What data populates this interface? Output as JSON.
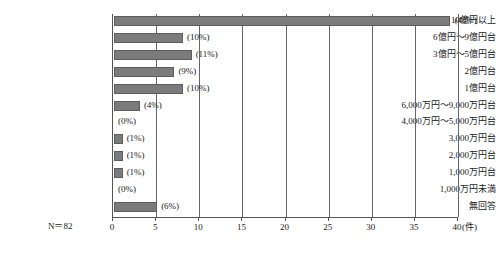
{
  "chart_data": {
    "type": "bar",
    "orientation": "horizontal",
    "title": "",
    "subtitle": "",
    "xlabel": "(件)",
    "ylabel": "",
    "xlim": [
      0,
      40
    ],
    "grid": true,
    "legend": "none",
    "note": "N＝82",
    "bar_color": "#7b7b7b",
    "bar_edge_color": "#5d5d5d",
    "xticks": [
      0,
      5,
      10,
      15,
      20,
      25,
      30,
      35,
      40
    ],
    "xtick_labels": [
      "0",
      "5",
      "10",
      "15",
      "20",
      "25",
      "30",
      "35",
      "40"
    ],
    "categories": [
      "10億円以上",
      "6億円〜9億円台",
      "3億円〜5億円台",
      "2億円台",
      "1億円台",
      "6,000万円〜9,000万円台",
      "4,000万円〜5,000万円台",
      "3,000万円台",
      "2,000万円台",
      "1,000万円台",
      "1,000万円未満",
      "無回答"
    ],
    "values": [
      39,
      8,
      9,
      7,
      8,
      3,
      0,
      1,
      1,
      1,
      0,
      5
    ],
    "percent_labels": [
      "(48%)",
      "(10%)",
      "(11%)",
      "(9%)",
      "(10%)",
      "(4%)",
      "(0%)",
      "(1%)",
      "(1%)",
      "(1%)",
      "(0%)",
      "(6%)"
    ]
  }
}
